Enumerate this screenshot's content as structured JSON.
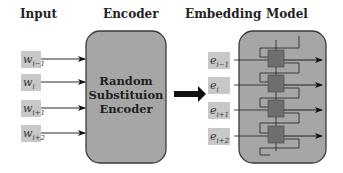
{
  "headers": {
    "input": "Input",
    "encoder": "Encoder",
    "embedding": "Embedding",
    "model": "Model"
  },
  "encoder": {
    "lines": [
      "Random",
      "Substituion",
      "Encoder"
    ]
  },
  "inputs": [
    {
      "base": "w",
      "sub": "i−1"
    },
    {
      "base": "w",
      "sub": "i"
    },
    {
      "base": "w",
      "sub": "i+1"
    },
    {
      "base": "w",
      "sub": "i+2"
    }
  ],
  "embeddings": [
    {
      "base": "e",
      "sub": "i−1"
    },
    {
      "base": "e",
      "sub": "i"
    },
    {
      "base": "e",
      "sub": "i+1"
    },
    {
      "base": "e",
      "sub": "i+2"
    }
  ],
  "colors": {
    "box_fill": "#a6a6a6",
    "box_stroke": "#3a3a3a",
    "token_fill": "#c8c8c8",
    "cell_fill": "#6e6e6e",
    "arrow": "#111111"
  }
}
